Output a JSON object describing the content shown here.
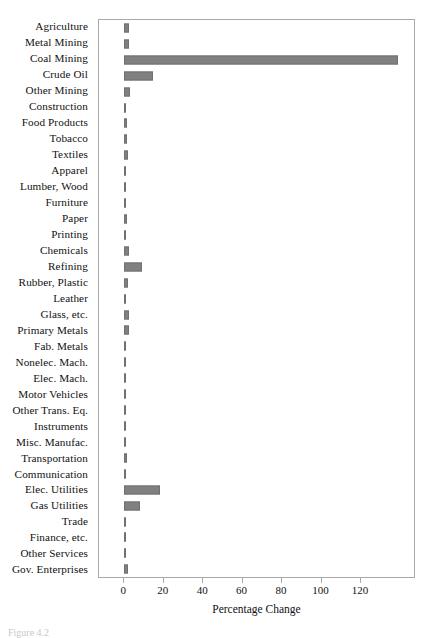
{
  "figure": {
    "caption": "Figure 4.2"
  },
  "chart_data": {
    "type": "bar",
    "orientation": "horizontal",
    "title": "",
    "xlabel": "Percentage Change",
    "ylabel": "",
    "xlim": [
      -2,
      158
    ],
    "xticks": [
      0,
      20,
      40,
      60,
      80,
      100,
      120
    ],
    "xtick_labels": [
      "0",
      "20",
      "40",
      "60",
      "80",
      "100",
      "120"
    ],
    "grid": false,
    "legend": null,
    "bar_color": "#808080",
    "frame_color": "#a9a9a9",
    "categories": [
      "Agriculture",
      "Metal Mining",
      "Coal Mining",
      "Crude Oil",
      "Other Mining",
      "Construction",
      "Food Products",
      "Tobacco",
      "Textiles",
      "Apparel",
      "Lumber, Wood",
      "Furniture",
      "Paper",
      "Printing",
      "Chemicals",
      "Refining",
      "Rubber, Plastic",
      "Leather",
      "Glass, etc.",
      "Primary Metals",
      "Fab. Metals",
      "Nonelec. Mach.",
      "Elec. Mach.",
      "Motor Vehicles",
      "Other Trans. Eq.",
      "Instruments",
      "Misc. Manufac.",
      "Transportation",
      "Communication",
      "Elec. Utilities",
      "Gas Utilities",
      "Trade",
      "Finance, etc.",
      "Other Services",
      "Gov. Enterprises"
    ],
    "values": [
      2.2,
      2.6,
      138.7,
      14.4,
      3.1,
      1.0,
      1.2,
      1.2,
      2.1,
      0.9,
      1.1,
      0.9,
      1.5,
      0.8,
      2.4,
      8.8,
      1.9,
      0.5,
      2.6,
      2.5,
      1.1,
      0.8,
      0.7,
      0.9,
      0.8,
      0.7,
      0.7,
      1.5,
      1.1,
      18.3,
      7.9,
      0.9,
      0.7,
      0.9,
      1.9
    ]
  }
}
